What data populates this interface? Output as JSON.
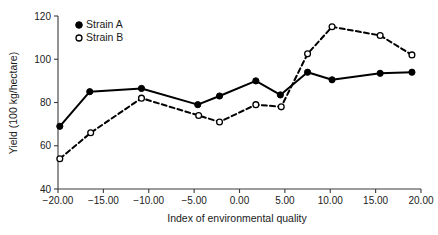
{
  "chart_data": {
    "type": "line",
    "title": "",
    "xlabel": "Index of environmental quality",
    "ylabel": "Yield (100 kg/hectare)",
    "xlim": [
      -20,
      20
    ],
    "ylim": [
      40,
      120
    ],
    "xticks": [
      -20,
      -15,
      -10,
      -5,
      0,
      5,
      10,
      15,
      20
    ],
    "xticklabels": [
      "−20.00",
      "−15.00",
      "−10.00",
      "−5.00",
      "0.00",
      "5.00",
      "10.00",
      "15.00",
      "20.00"
    ],
    "yticks": [
      40,
      60,
      80,
      100,
      120
    ],
    "yticklabels": [
      "40",
      "60",
      "80",
      "100",
      "120"
    ],
    "grid": false,
    "legend_position": "upper-left",
    "series": [
      {
        "name": "Strain A",
        "marker": "filled-circle",
        "linestyle": "solid",
        "color": "#000000",
        "x": [
          -19.8,
          -16.5,
          -10.8,
          -4.6,
          -2.2,
          1.8,
          4.5,
          7.5,
          10.2,
          15.5,
          19.0
        ],
        "values": [
          69,
          85,
          86.5,
          79,
          83,
          90,
          83.5,
          94,
          90.5,
          93.5,
          94
        ]
      },
      {
        "name": "Strain B",
        "marker": "open-circle",
        "linestyle": "dashed",
        "color": "#000000",
        "x": [
          -19.8,
          -16.4,
          -10.8,
          -4.5,
          -2.2,
          1.8,
          4.6,
          7.5,
          10.2,
          15.5,
          19.0
        ],
        "values": [
          54,
          66,
          82,
          74,
          71,
          79,
          78,
          102.5,
          115,
          111,
          102
        ]
      }
    ]
  },
  "legend": {
    "items": [
      {
        "label": "Strain A",
        "marker": "filled-circle"
      },
      {
        "label": "Strain B",
        "marker": "open-circle"
      }
    ]
  }
}
